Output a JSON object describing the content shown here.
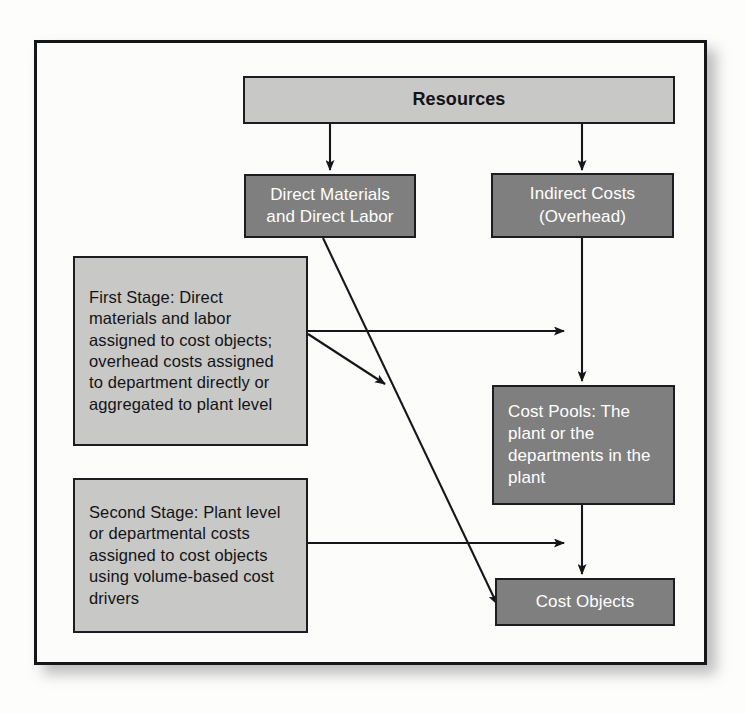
{
  "diagram": {
    "colors": {
      "dark_box_fill": "#7f7f7f",
      "dark_box_text": "#ffffff",
      "light_box_fill": "#c8c8c6",
      "light_box_text": "#131316",
      "border": "#1c1d21",
      "connector": "#15161a",
      "page_background": "#fdfdfc"
    },
    "nodes": {
      "resources": {
        "label": "Resources",
        "style": "light",
        "align": "center"
      },
      "direct_costs": {
        "label": "Direct Materials\nand Direct Labor",
        "style": "dark",
        "align": "center"
      },
      "indirect_costs": {
        "label": "Indirect Costs\n(Overhead)",
        "style": "dark",
        "align": "center"
      },
      "first_stage": {
        "label": "First Stage: Direct materials and labor assigned to cost objects; overhead costs assigned to department directly or aggregated to plant level",
        "style": "light",
        "align": "left"
      },
      "second_stage": {
        "label": "Second Stage: Plant level or departmental costs assigned to cost objects using volume-based cost drivers",
        "style": "light",
        "align": "left"
      },
      "cost_pools": {
        "label": "Cost Pools: The plant or the departments in the plant",
        "style": "dark",
        "align": "left"
      },
      "cost_objects": {
        "label": "Cost Objects",
        "style": "dark",
        "align": "center"
      }
    },
    "connectors": [
      {
        "id": "resources-to-direct",
        "from": "resources",
        "to": "direct_costs",
        "kind": "arrow-down"
      },
      {
        "id": "resources-to-indirect",
        "from": "resources",
        "to": "indirect_costs",
        "kind": "arrow-down"
      },
      {
        "id": "indirect-to-cost-pools",
        "from": "indirect_costs",
        "to": "cost_pools",
        "kind": "arrow-down"
      },
      {
        "id": "cost-pools-to-cost-objects",
        "from": "cost_pools",
        "to": "cost_objects",
        "kind": "arrow-down"
      },
      {
        "id": "direct-to-cost-objects",
        "from": "direct_costs",
        "to": "cost_objects",
        "kind": "arrow-diagonal"
      },
      {
        "id": "first-stage-to-overhead-path",
        "from": "first_stage",
        "to": "indirect_costs",
        "kind": "arrow-right"
      },
      {
        "id": "first-stage-to-direct-path",
        "from": "first_stage",
        "to": "direct_costs",
        "kind": "arrow-diagonal"
      },
      {
        "id": "second-stage-to-cost-objects",
        "from": "second_stage",
        "to": "cost_objects",
        "kind": "arrow-right"
      }
    ]
  }
}
